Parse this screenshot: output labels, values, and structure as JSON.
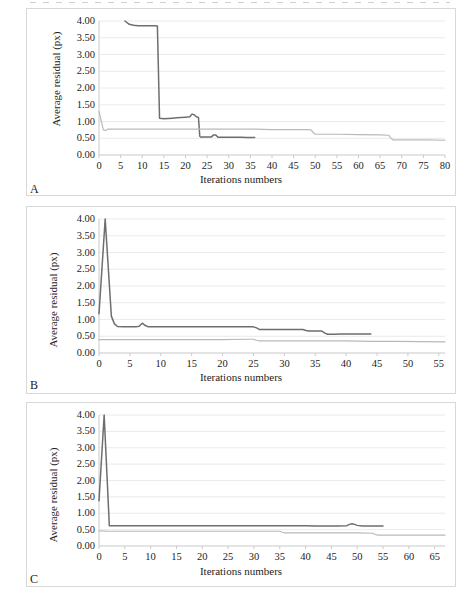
{
  "figure": {
    "panels": [
      {
        "id": "A",
        "letter": "A",
        "ylabel": "Average residual (px)",
        "xlabel": "Iterations numbers"
      },
      {
        "id": "B",
        "letter": "B",
        "ylabel": "Average residual (px)",
        "xlabel": "Iterations numbers"
      },
      {
        "id": "C",
        "letter": "C",
        "ylabel": "Average residual (px)",
        "xlabel": "Iterations numbers"
      }
    ]
  },
  "colors": {
    "series_dark": "#6e6e6e",
    "series_light": "#b9b9b9",
    "gridline": "#eceaea",
    "axis": "#c9c9c9",
    "panel_border": "#d8d8d8",
    "text": "#1d1d1d"
  },
  "chart_data": [
    {
      "type": "line",
      "title": "A",
      "xlabel": "Iterations numbers",
      "ylabel": "Average residual (px)",
      "xlim": [
        0,
        80
      ],
      "ylim": [
        0,
        4.0
      ],
      "xticks": [
        0,
        5,
        10,
        15,
        20,
        25,
        30,
        35,
        40,
        45,
        50,
        55,
        60,
        65,
        70,
        75,
        80
      ],
      "yticks": [
        0.0,
        0.5,
        1.0,
        1.5,
        2.0,
        2.5,
        3.0,
        3.5,
        4.0
      ],
      "ytick_labels": [
        "0.00",
        "0.50",
        "1.00",
        "1.50",
        "2.00",
        "2.50",
        "3.00",
        "3.50",
        "4.00"
      ],
      "xtick_labels": [
        "0",
        "5",
        "10",
        "15",
        "20",
        "25",
        "30",
        "35",
        "40",
        "45",
        "50",
        "55",
        "60",
        "65",
        "70",
        "75",
        "80"
      ],
      "grid": true,
      "legend": "none",
      "series": [
        {
          "name": "series-dark",
          "color": "#6e6e6e",
          "x": [
            6,
            7,
            8,
            9,
            10,
            11,
            12,
            13,
            13.5,
            14,
            15,
            16,
            17,
            18,
            19,
            20,
            21,
            21.5,
            22,
            22.5,
            23,
            23.3,
            23.6,
            24,
            25,
            26,
            26.5,
            27,
            27.5,
            28,
            29,
            30,
            31,
            32,
            33,
            34,
            35,
            36
          ],
          "y": [
            4.0,
            3.9,
            3.87,
            3.86,
            3.86,
            3.86,
            3.86,
            3.86,
            3.85,
            1.1,
            1.08,
            1.09,
            1.1,
            1.11,
            1.12,
            1.13,
            1.14,
            1.22,
            1.2,
            1.14,
            1.12,
            0.56,
            0.53,
            0.54,
            0.54,
            0.54,
            0.6,
            0.6,
            0.53,
            0.53,
            0.53,
            0.53,
            0.53,
            0.53,
            0.53,
            0.52,
            0.52,
            0.52
          ]
        },
        {
          "name": "series-light",
          "color": "#b9b9b9",
          "x": [
            0,
            1,
            1.5,
            2,
            4,
            8,
            12,
            16,
            20,
            24,
            28,
            32,
            36,
            40,
            44,
            48,
            49,
            49.5,
            50,
            55,
            60,
            65,
            67,
            67.5,
            68,
            72,
            76,
            80
          ],
          "y": [
            1.3,
            0.75,
            0.73,
            0.77,
            0.77,
            0.77,
            0.77,
            0.77,
            0.77,
            0.77,
            0.77,
            0.77,
            0.77,
            0.76,
            0.76,
            0.76,
            0.75,
            0.68,
            0.62,
            0.62,
            0.61,
            0.6,
            0.59,
            0.5,
            0.45,
            0.45,
            0.45,
            0.44
          ]
        }
      ]
    },
    {
      "type": "line",
      "title": "B",
      "xlabel": "Iterations numbers",
      "ylabel": "Average residual (px)",
      "xlim": [
        0,
        56
      ],
      "ylim": [
        0,
        4.0
      ],
      "xticks": [
        0,
        5,
        10,
        15,
        20,
        25,
        30,
        35,
        40,
        45,
        50,
        55
      ],
      "yticks": [
        0.0,
        0.5,
        1.0,
        1.5,
        2.0,
        2.5,
        3.0,
        3.5,
        4.0
      ],
      "ytick_labels": [
        "0.00",
        "0.50",
        "1.00",
        "1.50",
        "2.00",
        "2.50",
        "3.00",
        "3.50",
        "4.00"
      ],
      "xtick_labels": [
        "0",
        "5",
        "10",
        "15",
        "20",
        "25",
        "30",
        "35",
        "40",
        "45",
        "50",
        "55"
      ],
      "grid": true,
      "legend": "none",
      "series": [
        {
          "name": "series-dark",
          "color": "#6e6e6e",
          "x": [
            0,
            1,
            2,
            2.5,
            3,
            4,
            5,
            6,
            6.5,
            7,
            7.5,
            8,
            9,
            10,
            12,
            14,
            16,
            18,
            20,
            22,
            24,
            25,
            25.5,
            26,
            26.5,
            27,
            28,
            30,
            32,
            33,
            33.5,
            34,
            35,
            36,
            36.5,
            37,
            38,
            39,
            40,
            41,
            42,
            43,
            44
          ],
          "y": [
            1.17,
            4.0,
            1.1,
            0.87,
            0.79,
            0.78,
            0.78,
            0.78,
            0.8,
            0.89,
            0.82,
            0.78,
            0.78,
            0.78,
            0.78,
            0.78,
            0.78,
            0.78,
            0.78,
            0.78,
            0.78,
            0.78,
            0.75,
            0.7,
            0.7,
            0.7,
            0.7,
            0.7,
            0.7,
            0.7,
            0.67,
            0.66,
            0.66,
            0.66,
            0.6,
            0.56,
            0.56,
            0.57,
            0.57,
            0.57,
            0.57,
            0.57,
            0.57
          ]
        },
        {
          "name": "series-light",
          "color": "#b9b9b9",
          "x": [
            0,
            2,
            5,
            10,
            15,
            20,
            24,
            25,
            25.5,
            26,
            28,
            32,
            36,
            40,
            44,
            48,
            52,
            56
          ],
          "y": [
            0.4,
            0.4,
            0.4,
            0.4,
            0.4,
            0.4,
            0.41,
            0.41,
            0.38,
            0.36,
            0.36,
            0.36,
            0.36,
            0.36,
            0.35,
            0.35,
            0.34,
            0.33
          ]
        }
      ]
    },
    {
      "type": "line",
      "title": "C",
      "xlabel": "Iterations numbers",
      "ylabel": "Average residual (px)",
      "xlim": [
        0,
        67
      ],
      "ylim": [
        0,
        4.0
      ],
      "xticks": [
        0,
        5,
        10,
        15,
        20,
        25,
        30,
        35,
        40,
        45,
        50,
        55,
        60,
        65
      ],
      "yticks": [
        0.0,
        0.5,
        1.0,
        1.5,
        2.0,
        2.5,
        3.0,
        3.5,
        4.0
      ],
      "ytick_labels": [
        "0.00",
        "0.50",
        "1.00",
        "1.50",
        "2.00",
        "2.50",
        "3.00",
        "3.50",
        "4.00"
      ],
      "xtick_labels": [
        "0",
        "5",
        "10",
        "15",
        "20",
        "25",
        "30",
        "35",
        "40",
        "45",
        "50",
        "55",
        "60",
        "65"
      ],
      "grid": true,
      "legend": "none",
      "series": [
        {
          "name": "series-dark",
          "color": "#6e6e6e",
          "x": [
            0,
            1,
            2,
            3,
            5,
            10,
            15,
            20,
            25,
            30,
            35,
            38,
            40,
            42,
            44,
            46,
            48,
            48.5,
            49,
            49.5,
            50,
            51,
            52,
            53,
            54,
            55
          ],
          "y": [
            1.38,
            4.0,
            0.62,
            0.62,
            0.62,
            0.62,
            0.62,
            0.62,
            0.62,
            0.62,
            0.62,
            0.62,
            0.62,
            0.61,
            0.61,
            0.61,
            0.62,
            0.66,
            0.68,
            0.66,
            0.63,
            0.61,
            0.61,
            0.61,
            0.61,
            0.61
          ]
        },
        {
          "name": "series-light",
          "color": "#b9b9b9",
          "x": [
            0,
            2,
            5,
            10,
            15,
            20,
            25,
            30,
            34,
            35,
            35.5,
            36,
            38,
            42,
            46,
            50,
            53,
            53.5,
            54,
            58,
            62,
            67
          ],
          "y": [
            0.46,
            0.45,
            0.45,
            0.45,
            0.45,
            0.45,
            0.45,
            0.45,
            0.45,
            0.45,
            0.42,
            0.4,
            0.4,
            0.4,
            0.4,
            0.4,
            0.39,
            0.35,
            0.33,
            0.33,
            0.33,
            0.33
          ]
        }
      ]
    }
  ]
}
